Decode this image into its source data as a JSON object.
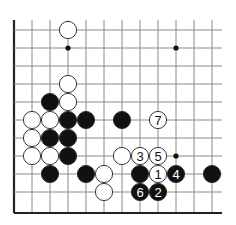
{
  "diagram": {
    "type": "go-board-fragment",
    "grid": {
      "columns_x": [
        14,
        32,
        50,
        68,
        86,
        104,
        122,
        140,
        158,
        176,
        194,
        212
      ],
      "rows_y": [
        30,
        48,
        66,
        84,
        102,
        120,
        138,
        156,
        174,
        192,
        213
      ],
      "top_extend_y": 20,
      "right_extend_x": 222,
      "left_edge": true,
      "bottom_edge": true,
      "line_color": "#8a8a8a",
      "edge_color": "#222222"
    },
    "star_points": [
      {
        "col": 3,
        "row": 1
      },
      {
        "col": 9,
        "row": 1
      },
      {
        "col": 9,
        "row": 7
      }
    ],
    "stones": [
      {
        "color": "white",
        "col": 3,
        "row": 0,
        "label": ""
      },
      {
        "color": "white",
        "col": 3,
        "row": 3,
        "label": ""
      },
      {
        "color": "white",
        "col": 3,
        "row": 4,
        "label": ""
      },
      {
        "color": "black",
        "col": 2,
        "row": 4,
        "label": ""
      },
      {
        "color": "white",
        "col": 1,
        "row": 5,
        "label": ""
      },
      {
        "color": "white",
        "col": 2,
        "row": 5,
        "label": ""
      },
      {
        "color": "black",
        "col": 3,
        "row": 5,
        "label": ""
      },
      {
        "color": "black",
        "col": 4,
        "row": 5,
        "label": ""
      },
      {
        "color": "black",
        "col": 6,
        "row": 5,
        "label": ""
      },
      {
        "color": "white",
        "col": 8,
        "row": 5,
        "label": "7"
      },
      {
        "color": "white",
        "col": 1,
        "row": 6,
        "label": ""
      },
      {
        "color": "black",
        "col": 2,
        "row": 6,
        "label": ""
      },
      {
        "color": "black",
        "col": 3,
        "row": 6,
        "label": ""
      },
      {
        "color": "white",
        "col": 1,
        "row": 7,
        "label": ""
      },
      {
        "color": "white",
        "col": 2,
        "row": 7,
        "label": ""
      },
      {
        "color": "black",
        "col": 3,
        "row": 7,
        "label": ""
      },
      {
        "color": "white",
        "col": 6,
        "row": 7,
        "label": ""
      },
      {
        "color": "white",
        "col": 7,
        "row": 7,
        "label": "3"
      },
      {
        "color": "white",
        "col": 8,
        "row": 7,
        "label": "5"
      },
      {
        "color": "black",
        "col": 2,
        "row": 8,
        "label": ""
      },
      {
        "color": "black",
        "col": 4,
        "row": 8,
        "label": ""
      },
      {
        "color": "white",
        "col": 5,
        "row": 8,
        "label": ""
      },
      {
        "color": "black",
        "col": 7,
        "row": 8,
        "label": ""
      },
      {
        "color": "white",
        "col": 8,
        "row": 8,
        "label": "1"
      },
      {
        "color": "black",
        "col": 9,
        "row": 8,
        "label": "4"
      },
      {
        "color": "black",
        "col": 11,
        "row": 8,
        "label": ""
      },
      {
        "color": "white",
        "col": 5,
        "row": 9,
        "label": ""
      },
      {
        "color": "black",
        "col": 7,
        "row": 9,
        "label": "6"
      },
      {
        "color": "black",
        "col": 8,
        "row": 9,
        "label": "2"
      }
    ],
    "stone_radius": 8.6,
    "colors": {
      "black_fill": "#111111",
      "white_fill": "#ffffff",
      "stone_outline": "#222222",
      "label_on_black": "#ffffff",
      "label_on_white": "#111111"
    }
  }
}
